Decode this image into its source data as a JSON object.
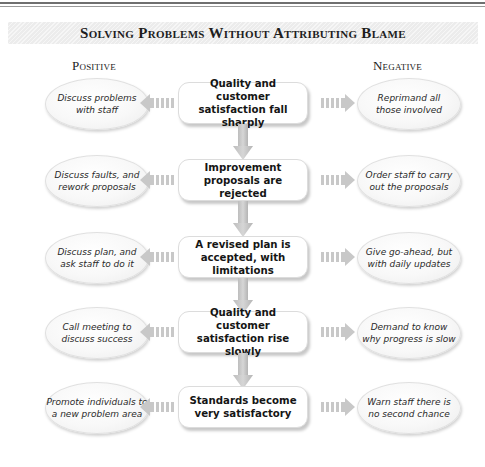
{
  "title": "Solving Problems Without Attributing Blame",
  "columns": {
    "positive": "Positive",
    "negative": "Negative"
  },
  "rows": [
    {
      "center": "Quality and customer\nsatisfaction fall sharply",
      "positive": "Discuss problems\nwith staff",
      "negative": "Reprimand all\nthose involved"
    },
    {
      "center": "Improvement\nproposals are rejected",
      "positive": "Discuss faults, and\nrework proposals",
      "negative": "Order staff to carry\nout the proposals"
    },
    {
      "center": "A revised plan is\naccepted, with limitations",
      "positive": "Discuss plan, and\nask staff to do it",
      "negative": "Give go-ahead, but\nwith daily updates"
    },
    {
      "center": "Quality and customer\nsatisfaction rise slowly",
      "positive": "Call meeting to\ndiscuss success",
      "negative": "Demand to know\nwhy progress is slow"
    },
    {
      "center": "Standards become\nvery satisfactory",
      "positive": "Promote individuals to\na new problem area",
      "negative": "Warn staff there is\nno second chance"
    }
  ],
  "icons": {
    "left_arrow": "striped-arrow-left-icon",
    "right_arrow": "striped-arrow-right-icon",
    "down_arrow": "arrow-down-icon"
  },
  "colors": {
    "arrow_fill": "#c8c8c8",
    "box_border": "#dcdcdc",
    "title_band": "#ececec"
  }
}
